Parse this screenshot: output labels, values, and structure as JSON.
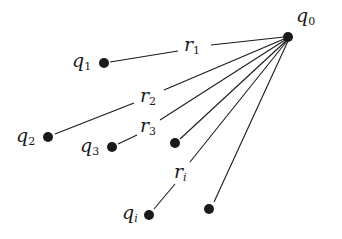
{
  "diagram": {
    "type": "charge-distances",
    "center": {
      "id": "q0",
      "label": "q",
      "subscript": "0",
      "x": 288,
      "y": 37,
      "label_x": 296,
      "label_y": 22
    },
    "charges": [
      {
        "id": "q1",
        "label": "q",
        "subscript": "1",
        "x": 104,
        "y": 63,
        "label_x": 72,
        "label_y": 68,
        "distance_label": "r",
        "distance_subscript": "1",
        "dlabel_x": 184,
        "dlabel_y": 50,
        "gap": [
          176,
          212
        ]
      },
      {
        "id": "q2",
        "label": "q",
        "subscript": "2",
        "x": 48,
        "y": 137,
        "label_x": 16,
        "label_y": 144,
        "distance_label": "r",
        "distance_subscript": "2",
        "dlabel_x": 140,
        "dlabel_y": 102,
        "gap": [
          133,
          165
        ]
      },
      {
        "id": "q3",
        "label": "q",
        "subscript": "3",
        "x": 112,
        "y": 147,
        "label_x": 80,
        "label_y": 154,
        "distance_label": "r",
        "distance_subscript": "3",
        "dlabel_x": 140,
        "dlabel_y": 132,
        "gap": [
          133,
          160
        ]
      },
      {
        "id": "unlabeled-a",
        "label": "",
        "subscript": "",
        "x": 175,
        "y": 143
      },
      {
        "id": "qi",
        "label": "q",
        "subscript": "i",
        "x": 149,
        "y": 215,
        "label_x": 122,
        "label_y": 221,
        "distance_label": "r",
        "distance_subscript": "i",
        "dlabel_x": 175,
        "dlabel_y": 177,
        "gap": [
          165,
          190
        ]
      },
      {
        "id": "unlabeled-b",
        "label": "",
        "subscript": "",
        "x": 209,
        "y": 209
      }
    ]
  },
  "labels": {
    "q0": "q",
    "q0_sub": "0",
    "q1": "q",
    "q1_sub": "1",
    "q2": "q",
    "q2_sub": "2",
    "q3": "q",
    "q3_sub": "3",
    "qi": "q",
    "qi_sub": "i",
    "r1": "r",
    "r1_sub": "1",
    "r2": "r",
    "r2_sub": "2",
    "r3": "r",
    "r3_sub": "3",
    "ri": "r",
    "ri_sub": "i"
  },
  "colors": {
    "ink": "#1a1a1a",
    "background": "#ffffff"
  }
}
